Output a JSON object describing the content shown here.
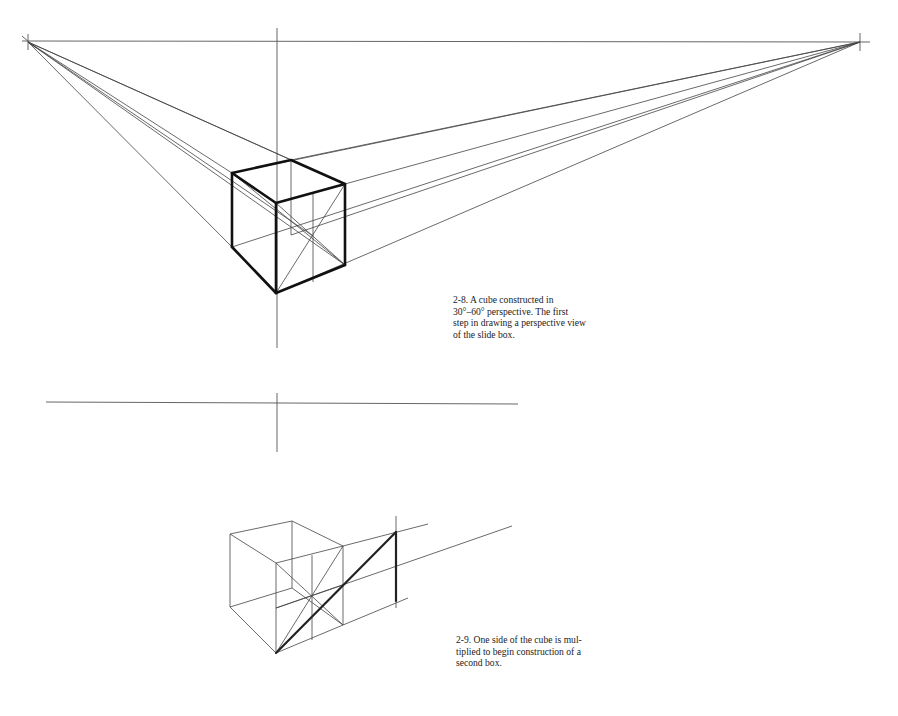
{
  "figure_2_8": {
    "caption_lines": [
      "2-8. A cube constructed in",
      "30°–60° perspective. The first",
      "step in drawing a perspective view",
      "of the slide box."
    ],
    "description": "Cube in two-point perspective with horizon line, vertical measuring line, and vanishing-point construction lines"
  },
  "figure_2_9": {
    "caption_lines": [
      "2-9. One side of the cube is mul-",
      "tiplied to begin construction of a",
      "second box."
    ],
    "description": "Cube with diagonal extension used to multiply one side toward a second box"
  },
  "colors": {
    "ink": "#111111",
    "paper": "#ffffff"
  }
}
